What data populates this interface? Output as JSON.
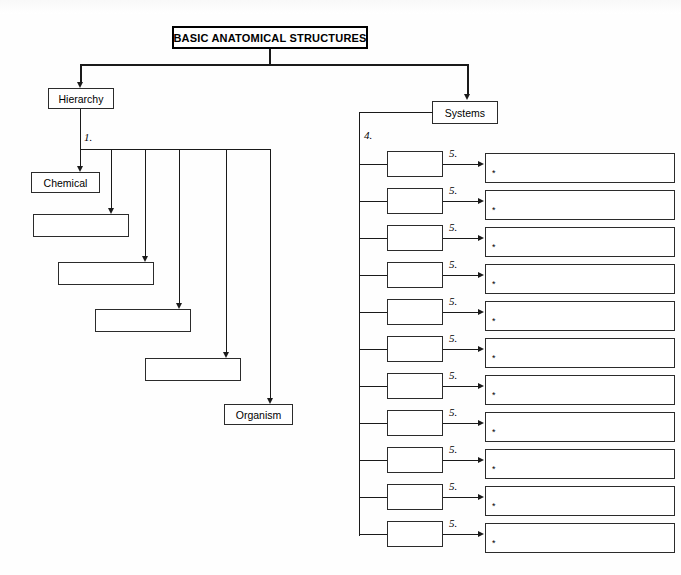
{
  "title_box": {
    "label": "BASIC ANATOMICAL STRUCTURES"
  },
  "branches": {
    "hierarchy": {
      "label": "Hierarchy"
    },
    "systems": {
      "label": "Systems"
    }
  },
  "step_labels": {
    "hierarchy_levels": "1.",
    "systems_spine": "4.",
    "organ_row": "5."
  },
  "hierarchy_chain": {
    "note": "six cascading levels; first and last are pre-filled, middle four are blank answer boxes",
    "items": [
      {
        "label": "Chemical",
        "blank": false
      },
      {
        "label": "",
        "blank": true
      },
      {
        "label": "",
        "blank": true
      },
      {
        "label": "",
        "blank": true
      },
      {
        "label": "",
        "blank": true
      },
      {
        "label": "Organism",
        "blank": false
      }
    ]
  },
  "systems_rows": {
    "count": 11,
    "bullet": "*",
    "rows": [
      {
        "system": "",
        "organs": ""
      },
      {
        "system": "",
        "organs": ""
      },
      {
        "system": "",
        "organs": ""
      },
      {
        "system": "",
        "organs": ""
      },
      {
        "system": "",
        "organs": ""
      },
      {
        "system": "",
        "organs": ""
      },
      {
        "system": "",
        "organs": ""
      },
      {
        "system": "",
        "organs": ""
      },
      {
        "system": "",
        "organs": ""
      },
      {
        "system": "",
        "organs": ""
      },
      {
        "system": "",
        "organs": ""
      }
    ]
  },
  "colors": {
    "ink": "#1a1a1a",
    "box_border": "#2b2b2b",
    "page": "#ffffff"
  }
}
